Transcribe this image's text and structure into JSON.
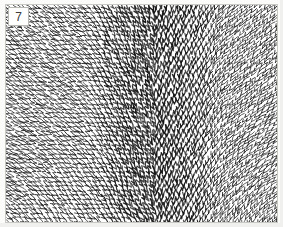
{
  "figure": {
    "label": "7",
    "caption": "",
    "plate": {
      "background_color": "#ffffff",
      "border_color": "#c9c9c4",
      "stroke_color": "#1a1a1a",
      "page_color": "#fbfbfa",
      "width": 273,
      "height": 219
    }
  },
  "chart_data": {
    "type": "heatmap",
    "title": "",
    "subtitle": "",
    "xlabel": "",
    "ylabel": "",
    "legend_position": "none",
    "grid": false,
    "xlim": [
      0,
      273
    ],
    "ylim": [
      0,
      219
    ],
    "stroke_style": {
      "glyph": "hook",
      "length_px": 7.5,
      "width_px": 1.1,
      "color": "#141414",
      "spacing_x": 5.0,
      "spacing_y": 4.6,
      "jitter": 0.9
    },
    "regions": [
      {
        "name": "central-vertical-band",
        "kind": "vertical-flow",
        "center_x": 150,
        "half_width": 78,
        "angle_deg": 90,
        "density": 1.0,
        "note": "strokes nearly vertical, arrow-barbed, densest column of the plate"
      },
      {
        "name": "upper-left-diagonal",
        "kind": "diagonal-flow",
        "angle_deg": 38,
        "density": 0.9,
        "note": "flows down-right toward the central seam"
      },
      {
        "name": "upper-right-diagonal",
        "kind": "diagonal-flow",
        "angle_deg": 142,
        "density": 0.9,
        "note": "mirror of upper-left, flows down-left toward the central seam"
      },
      {
        "name": "lower-left-arc",
        "kind": "radial-arc",
        "focus_x": -30,
        "focus_y": 250,
        "density": 0.95,
        "note": "broad arc boundary sweeping from left edge to bottom centre"
      },
      {
        "name": "lower-right-arc",
        "kind": "radial-arc",
        "focus_x": 305,
        "focus_y": 250,
        "density": 0.95,
        "note": "mirror arc sweeping from right edge to bottom centre"
      }
    ],
    "field_samples": [
      {
        "x": 25,
        "y": 25,
        "angle_deg": 40
      },
      {
        "x": 75,
        "y": 25,
        "angle_deg": 44
      },
      {
        "x": 120,
        "y": 25,
        "angle_deg": 62
      },
      {
        "x": 150,
        "y": 25,
        "angle_deg": 90
      },
      {
        "x": 185,
        "y": 25,
        "angle_deg": 118
      },
      {
        "x": 235,
        "y": 25,
        "angle_deg": 138
      },
      {
        "x": 25,
        "y": 80,
        "angle_deg": 36
      },
      {
        "x": 80,
        "y": 80,
        "angle_deg": 40
      },
      {
        "x": 120,
        "y": 80,
        "angle_deg": 78
      },
      {
        "x": 150,
        "y": 80,
        "angle_deg": 90
      },
      {
        "x": 185,
        "y": 80,
        "angle_deg": 104
      },
      {
        "x": 240,
        "y": 80,
        "angle_deg": 142
      },
      {
        "x": 25,
        "y": 140,
        "angle_deg": 48
      },
      {
        "x": 80,
        "y": 140,
        "angle_deg": 52
      },
      {
        "x": 120,
        "y": 140,
        "angle_deg": 84
      },
      {
        "x": 150,
        "y": 140,
        "angle_deg": 90
      },
      {
        "x": 185,
        "y": 140,
        "angle_deg": 98
      },
      {
        "x": 240,
        "y": 140,
        "angle_deg": 130
      },
      {
        "x": 25,
        "y": 200,
        "angle_deg": 60
      },
      {
        "x": 80,
        "y": 200,
        "angle_deg": 66
      },
      {
        "x": 120,
        "y": 200,
        "angle_deg": 86
      },
      {
        "x": 150,
        "y": 200,
        "angle_deg": 90
      },
      {
        "x": 185,
        "y": 200,
        "angle_deg": 96
      },
      {
        "x": 240,
        "y": 200,
        "angle_deg": 120
      }
    ]
  }
}
